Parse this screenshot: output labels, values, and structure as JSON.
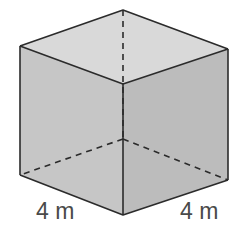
{
  "diagram": {
    "shape": "cube",
    "labels": {
      "left_edge": "4 m",
      "right_edge": "4 m"
    },
    "colors": {
      "top_face": "#d8d8d8",
      "left_face": "#c4c4c4",
      "right_face": "#bdbdbd",
      "edge": "#2b2b2b",
      "label": "#4a4a4a"
    }
  }
}
